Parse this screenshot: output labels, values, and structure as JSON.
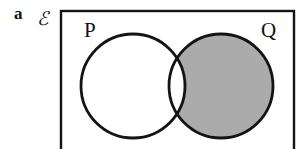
{
  "figure": {
    "part_label": "a",
    "universal_set_symbol": "ℰ",
    "caption": ""
  },
  "diagram": {
    "type": "venn-diagram",
    "sets": [
      {
        "id": "P",
        "label": "P",
        "shaded": false
      },
      {
        "id": "Q",
        "label": "Q",
        "shaded": true
      }
    ],
    "shaded_region": "Q-only",
    "shaded_region_expression": "Q ∩ P'",
    "intersection_shaded": false,
    "universe_shaded": false,
    "colors": {
      "shading": "#ababab",
      "outline": "#141414",
      "background": "#ffffff",
      "rectangle_border": "#141414"
    },
    "geometry": {
      "rectangle": {
        "x": 61,
        "y": 11,
        "width": 233,
        "height": 145
      },
      "circle_p": {
        "cx": 133,
        "cy": 86,
        "r": 52
      },
      "circle_q": {
        "cx": 221,
        "cy": 86,
        "r": 52
      }
    }
  }
}
